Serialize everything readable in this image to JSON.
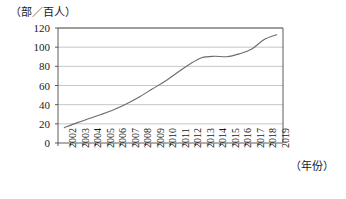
{
  "chart_data": {
    "type": "line",
    "title": "",
    "subtitle": "",
    "xlabel": "（年份）",
    "ylabel": "（部／百人）",
    "ylim": [
      0,
      120
    ],
    "yticks": [
      0,
      20,
      40,
      60,
      80,
      100,
      120
    ],
    "grid": true,
    "legend": "none",
    "series": [
      {
        "name": "每百人拥有移动电话数",
        "values": [
          16,
          21,
          25.5,
          30,
          35,
          41,
          48,
          56,
          64,
          73,
          82,
          89,
          90.5,
          90,
          93,
          98,
          108,
          113
        ]
      }
    ],
    "categories": [
      "2002",
      "2003",
      "2004",
      "2005",
      "2006",
      "2007",
      "2008",
      "2009",
      "2010",
      "2011",
      "2012",
      "2013",
      "2014",
      "2015",
      "2016",
      "2017",
      "2018",
      "2019"
    ],
    "x": [
      2002,
      2003,
      2004,
      2005,
      2006,
      2007,
      2008,
      2009,
      2010,
      2011,
      2012,
      2013,
      2014,
      2015,
      2016,
      2017,
      2018,
      2019
    ],
    "line_color": "#6b6b6b",
    "axis_color": "#4a4a4a",
    "grid_color": "#b8b8b8"
  }
}
